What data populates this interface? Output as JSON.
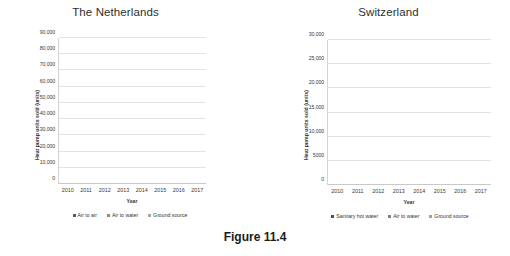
{
  "caption": "Figure 11.4",
  "chart_data": [
    {
      "type": "bar",
      "stacked": true,
      "title": "The Netherlands",
      "xlabel": "Year",
      "ylabel": "Heat pump units sold (units)",
      "categories": [
        "2010",
        "2011",
        "2012",
        "2013",
        "2014",
        "2015",
        "2016",
        "2017"
      ],
      "ylim": [
        0,
        90000
      ],
      "yticks": [
        "0",
        "10,000",
        "20,000",
        "30,000",
        "40,000",
        "50,000",
        "60,000",
        "70,000",
        "80,000",
        "90,000"
      ],
      "ytick_values": [
        0,
        10000,
        20000,
        30000,
        40000,
        50000,
        60000,
        70000,
        80000,
        90000
      ],
      "grid": true,
      "legend_position": "bottom",
      "series": [
        {
          "name": "Air to air",
          "color": "#595959",
          "values": [
            28000,
            29500,
            31000,
            32500,
            38500,
            42500,
            58000,
            60000
          ]
        },
        {
          "name": "Air to water",
          "color": "#8c8c8c",
          "values": [
            7500,
            8500,
            8500,
            7500,
            7500,
            8000,
            15000,
            24000
          ]
        },
        {
          "name": "Ground source",
          "color": "#a6a6a6",
          "values": [
            300,
            300,
            300,
            300,
            300,
            300,
            300,
            300
          ]
        }
      ],
      "totals": [
        35800,
        38300,
        39800,
        40300,
        46300,
        50800,
        73300,
        84300
      ]
    },
    {
      "type": "bar",
      "stacked": true,
      "title": "Switzerland",
      "xlabel": "Year",
      "ylabel": "Heat pump units sold (units)",
      "categories": [
        "2010",
        "2011",
        "2012",
        "2013",
        "2014",
        "2015",
        "2016",
        "2017"
      ],
      "ylim": [
        0,
        30000
      ],
      "yticks": [
        "0",
        "5000",
        "10,000",
        "15,000",
        "20,000",
        "25,000",
        "30,000"
      ],
      "ytick_values": [
        0,
        5000,
        10000,
        15000,
        20000,
        25000,
        30000
      ],
      "grid": true,
      "legend_position": "bottom",
      "series": [
        {
          "name": "Sanitary hot water",
          "color": "#4d4d4d",
          "values": [
            200,
            1100,
            2000,
            3100,
            4100,
            4600,
            5100,
            5400
          ]
        },
        {
          "name": "Air to water",
          "color": "#808080",
          "values": [
            12000,
            11200,
            10900,
            11800,
            11100,
            11700,
            12200,
            13800
          ]
        },
        {
          "name": "Ground source",
          "color": "#a0a0a0",
          "values": [
            8200,
            7800,
            8400,
            7500,
            7400,
            6700,
            6200,
            6300
          ]
        }
      ],
      "totals": [
        20400,
        20100,
        21300,
        22400,
        22600,
        23000,
        23500,
        25500
      ]
    }
  ]
}
